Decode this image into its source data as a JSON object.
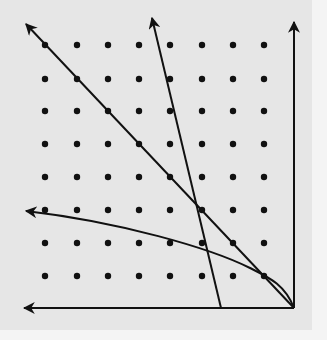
{
  "diagram": {
    "type": "dot-grid-geometry",
    "colors": {
      "background": "#e6e6e6",
      "margin": "#f4f4f4",
      "ink": "#111111"
    },
    "grid": {
      "columns_x": [
        45,
        77,
        108,
        139,
        170,
        202,
        233,
        264
      ],
      "rows_y": [
        45,
        79,
        111,
        144,
        177,
        210,
        243,
        276
      ],
      "dot_radius": 3.2
    },
    "origin": {
      "x": 294,
      "y": 308
    },
    "axes": [
      {
        "name": "vertical-axis",
        "from": [
          294,
          308
        ],
        "to": [
          294,
          22
        ]
      },
      {
        "name": "horizontal-axis",
        "from": [
          294,
          308
        ],
        "to": [
          24,
          308
        ]
      }
    ],
    "lines": [
      {
        "name": "diagonal-line",
        "from": [
          294,
          308
        ],
        "to": [
          26,
          24
        ]
      },
      {
        "name": "steep-line",
        "from": [
          221,
          308
        ],
        "to": [
          152,
          18
        ]
      }
    ],
    "curve": {
      "name": "curved-arrow",
      "path": "M294,308 C285,285 270,278 250,268 C210,248 120,222 26,211"
    },
    "annotations": []
  }
}
